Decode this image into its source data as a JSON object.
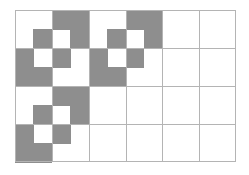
{
  "grid": {
    "cols": 6,
    "rows": 4,
    "shade_color": "#8e8e8e",
    "line_color": "#b4b4b4",
    "motif_halfcells": [
      [
        0,
        0,
        1,
        1
      ],
      [
        0,
        1,
        0,
        1
      ],
      [
        1,
        0,
        1,
        0
      ],
      [
        1,
        1,
        0,
        0
      ]
    ],
    "motif_positions": [
      {
        "col": 0,
        "row": 0
      },
      {
        "col": 2,
        "row": 0
      },
      {
        "col": 0,
        "row": 2
      }
    ]
  }
}
